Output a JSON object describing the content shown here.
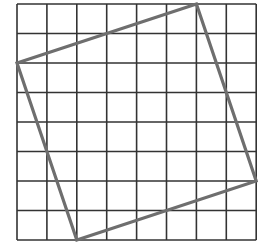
{
  "diagram": {
    "type": "grid-with-tilted-square",
    "grid": {
      "columns": 8,
      "rows": 8,
      "origin_px": [
        17,
        4
      ],
      "cell_w_px": 29.9,
      "cell_h_px": 29.5,
      "line_color": "#333333",
      "line_width": 1.6
    },
    "polygon": {
      "vertices_grid": [
        [
          0,
          2
        ],
        [
          6,
          0
        ],
        [
          8,
          6
        ],
        [
          2,
          8
        ]
      ],
      "stroke_color": "#6e6e6e",
      "stroke_width": 3.2
    }
  }
}
